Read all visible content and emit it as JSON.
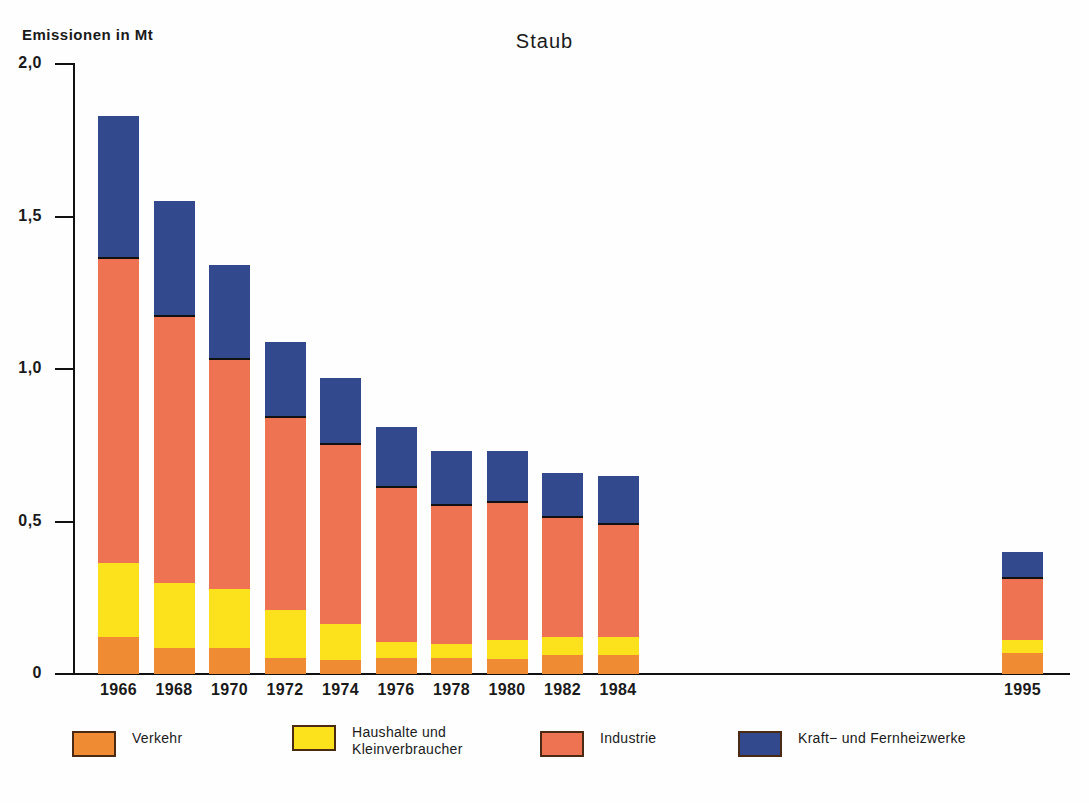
{
  "chart_data": {
    "type": "bar",
    "stacked": true,
    "title": "Staub",
    "ylabel": "Emissionen in Mt",
    "xlabel": "",
    "ylim": [
      0,
      2.0
    ],
    "ytick_labels": [
      "2,0",
      "1,5",
      "1,0",
      "0,5",
      "0"
    ],
    "ytick_values": [
      2.0,
      1.5,
      1.0,
      0.5,
      0
    ],
    "grid": false,
    "legend_position": "bottom",
    "categories": [
      "1966",
      "1968",
      "1970",
      "1972",
      "1974",
      "1976",
      "1978",
      "1980",
      "1982",
      "1984",
      "1995"
    ],
    "series": [
      {
        "name": "Verkehr",
        "color": "#ef8b33",
        "values": [
          0.12,
          0.085,
          0.085,
          0.052,
          0.046,
          0.052,
          0.052,
          0.05,
          0.062,
          0.062,
          0.07
        ]
      },
      {
        "name": "Haushalte und Kleinverbraucher",
        "color": "#fbe21c",
        "values": [
          0.245,
          0.215,
          0.195,
          0.158,
          0.118,
          0.053,
          0.048,
          0.06,
          0.058,
          0.058,
          0.04
        ]
      },
      {
        "name": "Industrie",
        "color": "#ee7352",
        "values": [
          0.995,
          0.87,
          0.75,
          0.63,
          0.586,
          0.505,
          0.45,
          0.45,
          0.39,
          0.37,
          0.2
        ]
      },
      {
        "name": "Kraft- und Fernheizwerke",
        "color": "#33498e",
        "values": [
          0.47,
          0.38,
          0.31,
          0.25,
          0.22,
          0.2,
          0.18,
          0.17,
          0.15,
          0.16,
          0.09
        ]
      }
    ],
    "totals": [
      1.83,
      1.55,
      1.34,
      1.09,
      0.97,
      0.81,
      0.73,
      0.73,
      0.66,
      0.65,
      0.4
    ]
  },
  "legend": {
    "items": [
      {
        "label": "Verkehr",
        "swatch": "sw-verkehr"
      },
      {
        "label": "Haushalte und\nKleinverbraucher",
        "swatch": "sw-haushalte"
      },
      {
        "label": "Industrie",
        "swatch": "sw-industrie"
      },
      {
        "label": "Kraft− und Fernheizwerke",
        "swatch": "sw-kraft"
      }
    ]
  }
}
